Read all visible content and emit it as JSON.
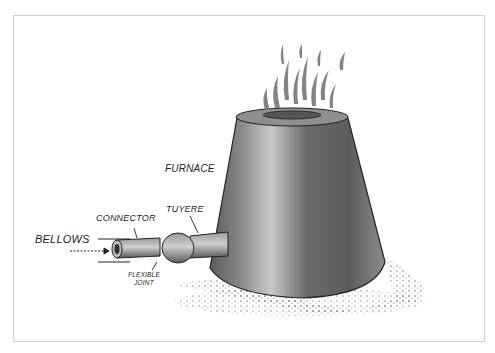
{
  "diagram": {
    "labels": {
      "furnace": "FURNACE",
      "tuyere": "TUYERE",
      "connector": "CONNECTOR",
      "bellows": "BELLOWS",
      "flexible_joint_line1": "FLEXIBLE",
      "flexible_joint_line2": "JOINT"
    },
    "colors": {
      "ink": "#222222",
      "shade": "#6e6e6e",
      "light": "#b9b9b9",
      "frame": "#cfcfcf"
    }
  }
}
